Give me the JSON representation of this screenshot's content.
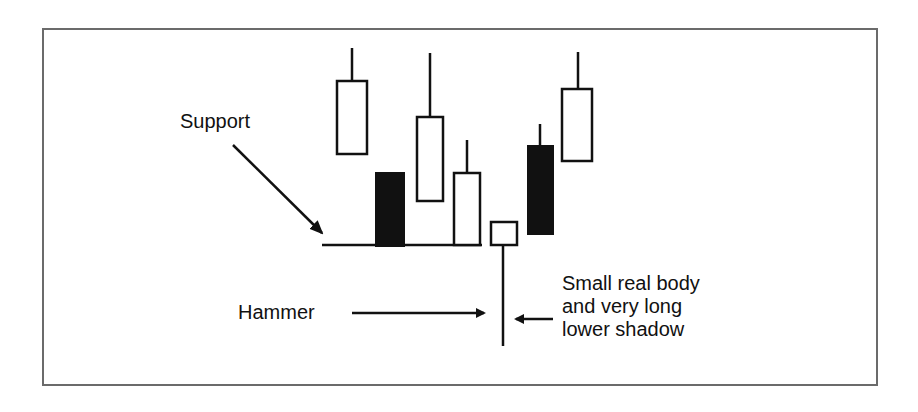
{
  "diagram": {
    "colors": {
      "frame_border": "#6b6b6b",
      "ink": "#111111",
      "background": "#ffffff"
    },
    "labels": {
      "support": "Support",
      "hammer": "Hammer",
      "description": [
        "Small real body",
        "and very long",
        "lower shadow"
      ]
    },
    "candles": [
      {
        "id": 1,
        "type": "hollow",
        "x": 336,
        "width": 32,
        "wick_top": 48,
        "body_top": 80,
        "body_bottom": 155,
        "wick_bottom": 155
      },
      {
        "id": 2,
        "type": "filled",
        "x": 375,
        "width": 30,
        "wick_top": 172,
        "body_top": 172,
        "body_bottom": 247,
        "wick_bottom": 247
      },
      {
        "id": 3,
        "type": "hollow",
        "x": 416,
        "width": 28,
        "wick_top": 53,
        "body_top": 116,
        "body_bottom": 202,
        "wick_bottom": 202
      },
      {
        "id": 4,
        "type": "hollow",
        "x": 453,
        "width": 28,
        "wick_top": 140,
        "body_top": 172,
        "body_bottom": 246,
        "wick_bottom": 246
      },
      {
        "id": 5,
        "type": "hollow",
        "x": 490,
        "width": 28,
        "wick_top": 221,
        "body_top": 221,
        "body_bottom": 245,
        "wick_bottom": 346,
        "name": "hammer"
      },
      {
        "id": 6,
        "type": "filled",
        "x": 527,
        "width": 27,
        "wick_top": 124,
        "body_top": 145,
        "body_bottom": 235,
        "wick_bottom": 235
      },
      {
        "id": 7,
        "type": "hollow",
        "x": 561,
        "width": 32,
        "wick_top": 52,
        "body_top": 88,
        "body_bottom": 162,
        "wick_bottom": 162
      }
    ],
    "support_line": {
      "x1": 322,
      "x2": 482,
      "y": 245
    }
  }
}
